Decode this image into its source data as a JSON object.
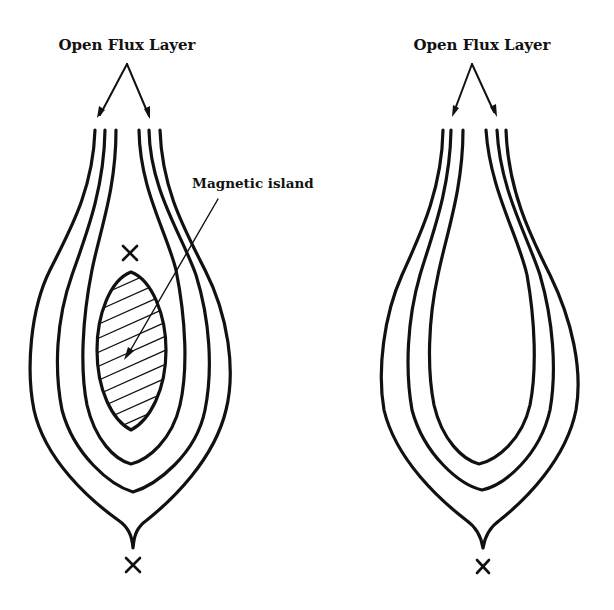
{
  "figure": {
    "panels": [
      {
        "id": "left",
        "title": "Open Flux Layer",
        "annotation": "Magnetic island",
        "has_magnetic_island": true,
        "x_points": 2
      },
      {
        "id": "right",
        "title": "Open Flux Layer",
        "has_magnetic_island": false,
        "x_points": 1
      }
    ],
    "x_point_symbol": "×",
    "colors": {
      "ink": "#111111",
      "background": "#ffffff"
    }
  }
}
